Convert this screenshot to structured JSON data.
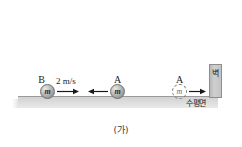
{
  "figure": {
    "caption": "(가)",
    "background_color": "#ffffff",
    "surface": {
      "label": "수평면",
      "color": "#dcdcdc",
      "edge_color": "#9a9a9a"
    },
    "wall": {
      "label": "벽",
      "color": "#c4c4c4",
      "border_color": "#8e8e8e"
    },
    "objects": [
      {
        "name": "B",
        "mass_symbol": "m",
        "style": "solid",
        "speed_label": "2 m/s",
        "arrow_direction": "right",
        "arrow_icon": "arrow-right-icon"
      },
      {
        "name": "A",
        "mass_symbol": "m",
        "style": "solid",
        "speed_label": "",
        "arrow_direction": "left",
        "arrow_icon": "arrow-left-icon"
      },
      {
        "name": "A",
        "mass_symbol": "m",
        "style": "dashed",
        "speed_label": "",
        "arrow_direction": "right",
        "arrow_icon": "arrow-right-icon"
      }
    ]
  }
}
